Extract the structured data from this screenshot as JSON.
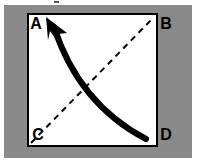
{
  "figure": {
    "kind": "geometry-diagram",
    "canvas": {
      "width": 197,
      "height": 166
    },
    "colors": {
      "page_background": "#ffffff",
      "frame_background": "#8a8a8a",
      "square_fill": "#ffffff",
      "stroke": "#000000",
      "label_color": "#000000"
    },
    "frame": {
      "x": 4,
      "y": 5,
      "width": 188,
      "height": 153
    },
    "square": {
      "x": 28,
      "y": 14,
      "width": 129,
      "height": 132,
      "stroke_width": 2
    },
    "vertices": [
      {
        "id": "A",
        "label": "A",
        "corner": "top-left",
        "label_x": 36,
        "label_y": 25
      },
      {
        "id": "B",
        "label": "B",
        "corner": "top-right",
        "label_x": 166,
        "label_y": 25
      },
      {
        "id": "C",
        "label": "C",
        "corner": "bottom-left",
        "label_x": 38,
        "label_y": 136
      },
      {
        "id": "D",
        "label": "D",
        "corner": "bottom-right",
        "label_x": 166,
        "label_y": 136
      }
    ],
    "dashed_diagonal": {
      "from": "C",
      "to": "B",
      "x1": 31,
      "y1": 143,
      "x2": 154,
      "y2": 17,
      "stroke_width": 2,
      "dash_pattern": "6 5"
    },
    "curved_arrow": {
      "from": "D",
      "to": "A",
      "tail_x": 146,
      "tail_y": 139,
      "control_x": 79,
      "control_y": 104,
      "head_x": 49,
      "head_y": 22,
      "stroke_width": 6,
      "arrowhead": "solid-triangle"
    },
    "tick_mark": {
      "x": 54,
      "y": 1,
      "width": 5,
      "height": 2
    }
  }
}
